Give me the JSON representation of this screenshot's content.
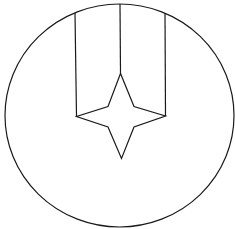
{
  "figure": {
    "stroke_color": "#1a1a1a",
    "background": "#ffffff",
    "circle": {
      "cx": 119.5,
      "cy": 115.5,
      "rx": 114.5,
      "ry": 111.5
    },
    "lines": {
      "left_vertical": {
        "x1": 75,
        "y1": 13,
        "x2": 76.5,
        "y2": 116.5
      },
      "center_vertical": {
        "x1": 120,
        "y1": 4,
        "x2": 120.5,
        "y2": 73.5
      },
      "right_vertical": {
        "x1": 165,
        "y1": 13,
        "x2": 165.5,
        "y2": 116
      }
    },
    "star_points": "120.5,73.5 108,106.5 76.5,116.5 108,127 121.5,158.5 134,127 165.5,116 134,106.5"
  }
}
